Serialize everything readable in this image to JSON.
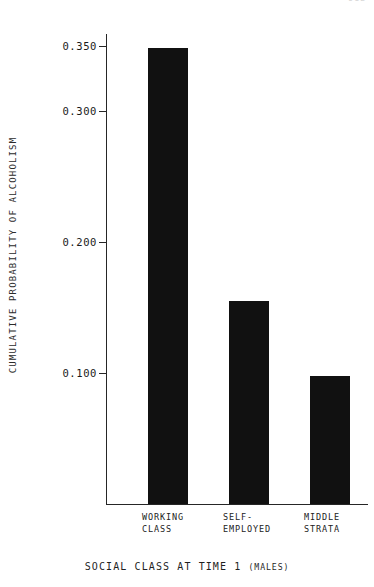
{
  "page": {
    "page_number": "512"
  },
  "chart_data": {
    "type": "bar",
    "title": "",
    "subtitle": "",
    "xlabel": "SOCIAL CLASS AT TIME 1 ",
    "xlabel_suffix": "(MALES)",
    "ylabel": "CUMULATIVE PROBABILITY OF ALCOHOLISM",
    "categories": [
      "WORKING\nCLASS",
      "SELF-\nEMPLOYED",
      "MIDDLE\nSTRATA"
    ],
    "category_lines": [
      [
        "WORKING",
        "CLASS"
      ],
      [
        "SELF-",
        "EMPLOYED"
      ],
      [
        "MIDDLE",
        "STRATA"
      ]
    ],
    "values": [
      0.348,
      0.155,
      0.098
    ],
    "ylim": [
      0.0,
      0.362
    ],
    "yticks": [
      0.1,
      0.2,
      0.3,
      0.35
    ],
    "ytick_labels": [
      "0.100",
      "0.200",
      "0.300",
      "0.350"
    ],
    "grid": false,
    "legend": null,
    "bar_color": "#111111",
    "axis_color": "#262626",
    "background_color": "#ffffff"
  }
}
